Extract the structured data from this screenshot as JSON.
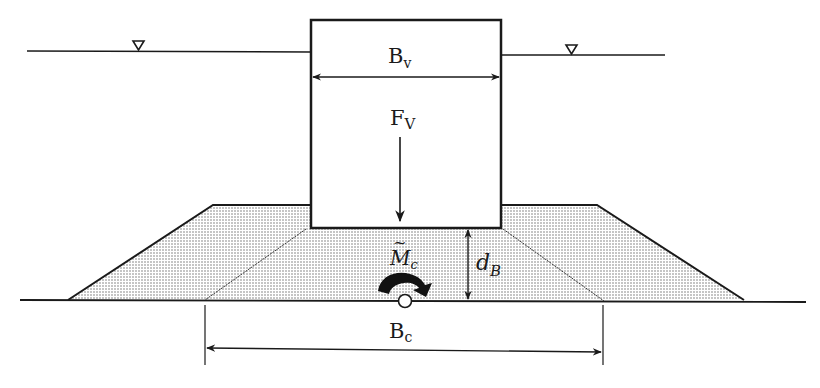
{
  "figure": {
    "labels": {
      "caisson_width": {
        "main": "B",
        "sub": "v"
      },
      "vertical_force": {
        "main": "F",
        "sub": "V"
      },
      "moment": {
        "main": "M",
        "sub": "c",
        "accent": "~"
      },
      "berm_depth": {
        "main": "d",
        "sub": "B"
      },
      "base_width": {
        "main": "B",
        "sub": "c"
      }
    },
    "symbols": {
      "water_level_left": "water-level-triangle",
      "water_level_right": "water-level-triangle",
      "moment_arrow": "curved-clockwise-arrow",
      "rotation_point": "hinge-circle"
    },
    "colors": {
      "ink": "#1a1a1a",
      "fill_dots": "#6e6e6e",
      "background": "#ffffff"
    }
  }
}
